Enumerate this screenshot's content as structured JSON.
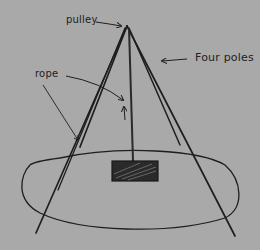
{
  "diagram": {
    "type": "hand-drawn sketch",
    "colors": {
      "background": "#a9a9a9",
      "ink": "#1e1e1e"
    },
    "labels": {
      "pulley": "pulley",
      "four_poles": "Four poles",
      "rope": "rope"
    },
    "components": [
      {
        "id": "pulley",
        "label": "pulley",
        "at": "apex"
      },
      {
        "id": "poles",
        "label": "Four poles",
        "count": 4
      },
      {
        "id": "rope",
        "label": "rope",
        "from": "pulley",
        "to": "weight"
      },
      {
        "id": "weight",
        "label": "",
        "shape": "hatched rectangle"
      },
      {
        "id": "base",
        "label": "",
        "shape": "ellipse"
      }
    ]
  }
}
